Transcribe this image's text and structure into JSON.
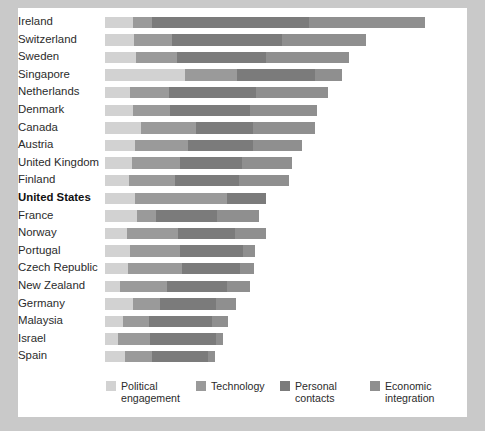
{
  "chart_data": {
    "type": "bar",
    "orientation": "horizontal",
    "stacked": true,
    "title": "",
    "subtitle": "",
    "xlabel": "",
    "ylabel": "",
    "grid": false,
    "legend_position": "bottom",
    "xlim": [
      0,
      100
    ],
    "categories": [
      "Ireland",
      "Switzerland",
      "Sweden",
      "Singapore",
      "Netherlands",
      "Denmark",
      "Canada",
      "Austria",
      "United Kingdom",
      "Finland",
      "United States",
      "France",
      "Norway",
      "Portugal",
      "Czech Republic",
      "New Zealand",
      "Germany",
      "Malaysia",
      "Israel",
      "Spain"
    ],
    "highlighted_category": "United States",
    "series": [
      {
        "name": "Political engagement",
        "color": "#d2d2d2",
        "values": [
          7.8,
          8.0,
          8.6,
          22.0,
          6.8,
          7.6,
          10.0,
          8.4,
          7.4,
          6.6,
          8.2,
          8.8,
          6.2,
          7.0,
          6.4,
          4.2,
          7.8,
          5.0,
          3.6,
          5.4
        ]
      },
      {
        "name": "Technology",
        "color": "#9a9a9a",
        "values": [
          5.2,
          10.6,
          11.2,
          14.6,
          10.8,
          10.4,
          15.2,
          14.6,
          13.4,
          12.6,
          25.6,
          5.2,
          14.0,
          13.6,
          14.8,
          13.0,
          7.4,
          7.2,
          8.8,
          7.6
        ]
      },
      {
        "name": "Personal contacts",
        "color": "#7b7b7b",
        "values": [
          43.4,
          30.2,
          24.6,
          21.4,
          24.2,
          22.0,
          15.8,
          18.0,
          17.0,
          17.8,
          10.8,
          17.0,
          15.6,
          17.4,
          16.0,
          16.6,
          15.6,
          17.4,
          18.2,
          15.4
        ]
      },
      {
        "name": "Economic integration",
        "color": "#8f8f8f",
        "values": [
          32.0,
          23.4,
          23.0,
          7.4,
          19.8,
          18.6,
          17.0,
          13.4,
          13.8,
          13.8,
          0.0,
          11.6,
          8.8,
          3.4,
          4.0,
          6.4,
          5.4,
          4.4,
          2.0,
          2.0
        ]
      }
    ]
  },
  "legend": {
    "items": [
      {
        "label": "Political\nengagement",
        "color": "#d2d2d2",
        "icon": "legend-swatch"
      },
      {
        "label": "Technology",
        "color": "#9a9a9a",
        "icon": "legend-swatch"
      },
      {
        "label": "Personal\ncontacts",
        "color": "#7b7b7b",
        "icon": "legend-swatch"
      },
      {
        "label": "Economic\nintegration",
        "color": "#8f8f8f",
        "icon": "legend-swatch"
      }
    ]
  }
}
